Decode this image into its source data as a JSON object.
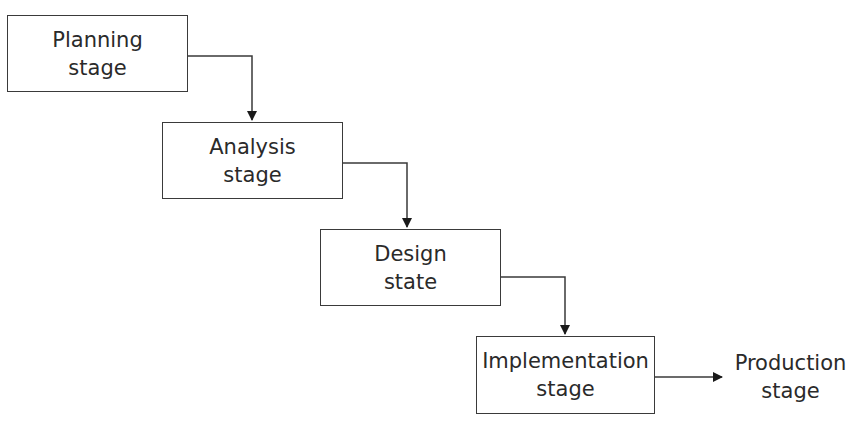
{
  "diagram": {
    "type": "waterfall-flow",
    "stages": [
      {
        "id": "planning",
        "line1": "Planning",
        "line2": "stage"
      },
      {
        "id": "analysis",
        "line1": "Analysis",
        "line2": "stage"
      },
      {
        "id": "design",
        "line1": "Design",
        "line2": "state"
      },
      {
        "id": "implementation",
        "line1": "Implementation",
        "line2": "stage"
      }
    ],
    "output": {
      "id": "production",
      "line1": "Production",
      "line2": "stage"
    },
    "edges": [
      {
        "from": "planning",
        "to": "analysis"
      },
      {
        "from": "analysis",
        "to": "design"
      },
      {
        "from": "design",
        "to": "implementation"
      },
      {
        "from": "implementation",
        "to": "production"
      }
    ],
    "colors": {
      "stroke": "#3a3a3a",
      "text": "#2a2a2a",
      "background": "#ffffff"
    }
  }
}
